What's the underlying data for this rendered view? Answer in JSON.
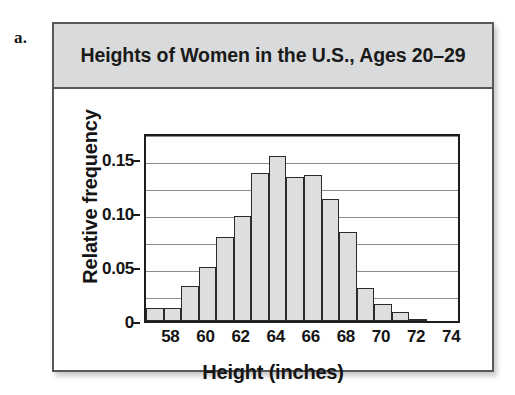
{
  "part_label": "a.",
  "card": {
    "title": "Heights of Women in the U.S., Ages 20–29"
  },
  "chart_data": {
    "type": "bar",
    "chart_subtype": "histogram",
    "title": "Heights of Women in the U.S., Ages 20–29",
    "xlabel": "Height (inches)",
    "ylabel": "Relative frequency",
    "xlim": [
      57,
      75
    ],
    "ylim": [
      0,
      0.175
    ],
    "grid": true,
    "gridlines_y": [
      0.025,
      0.05,
      0.075,
      0.1,
      0.125,
      0.15,
      0.175
    ],
    "y_ticks": [
      {
        "value": 0.15,
        "label": "0.15"
      },
      {
        "value": 0.1,
        "label": "0.10"
      },
      {
        "value": 0.05,
        "label": "0.05"
      },
      {
        "value": 0,
        "label": "0"
      }
    ],
    "x_ticks": [
      {
        "value": 58,
        "label": "58"
      },
      {
        "value": 60,
        "label": "60"
      },
      {
        "value": 62,
        "label": "62"
      },
      {
        "value": 64,
        "label": "64"
      },
      {
        "value": 66,
        "label": "66"
      },
      {
        "value": 68,
        "label": "68"
      },
      {
        "value": 70,
        "label": "70"
      },
      {
        "value": 72,
        "label": "72"
      },
      {
        "value": 74,
        "label": "74"
      }
    ],
    "bin_width": 1,
    "bars": [
      {
        "bin_start": 57,
        "bin_end": 58,
        "value": 0.012
      },
      {
        "bin_start": 58,
        "bin_end": 59,
        "value": 0.012
      },
      {
        "bin_start": 59,
        "bin_end": 60,
        "value": 0.032
      },
      {
        "bin_start": 60,
        "bin_end": 61,
        "value": 0.05
      },
      {
        "bin_start": 61,
        "bin_end": 62,
        "value": 0.078
      },
      {
        "bin_start": 62,
        "bin_end": 63,
        "value": 0.097
      },
      {
        "bin_start": 63,
        "bin_end": 64,
        "value": 0.137
      },
      {
        "bin_start": 64,
        "bin_end": 65,
        "value": 0.153
      },
      {
        "bin_start": 65,
        "bin_end": 66,
        "value": 0.133
      },
      {
        "bin_start": 66,
        "bin_end": 67,
        "value": 0.135
      },
      {
        "bin_start": 67,
        "bin_end": 68,
        "value": 0.113
      },
      {
        "bin_start": 68,
        "bin_end": 69,
        "value": 0.082
      },
      {
        "bin_start": 69,
        "bin_end": 70,
        "value": 0.031
      },
      {
        "bin_start": 70,
        "bin_end": 71,
        "value": 0.016
      },
      {
        "bin_start": 71,
        "bin_end": 72,
        "value": 0.008
      },
      {
        "bin_start": 72,
        "bin_end": 73,
        "value": 0.002
      },
      {
        "bin_start": 73,
        "bin_end": 74,
        "value": 0.001
      },
      {
        "bin_start": 74,
        "bin_end": 75,
        "value": 0.0
      }
    ],
    "colors": {
      "bar_fill": "#dededc",
      "bar_stroke": "#2b2b2b",
      "axis": "#1d1d1d",
      "grid": "#8d8d8d",
      "title_band": "#d9dadb",
      "card_border": "#58585a"
    }
  }
}
